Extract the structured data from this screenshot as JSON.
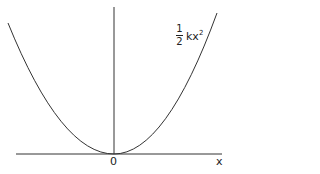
{
  "diagram": {
    "curve_label": {
      "numerator": "1",
      "denominator": "2",
      "expr": "kx",
      "exponent": "2"
    },
    "origin_label": "0",
    "x_axis_label": "x",
    "colors": {
      "line": "#222222",
      "background": "#ffffff"
    }
  }
}
